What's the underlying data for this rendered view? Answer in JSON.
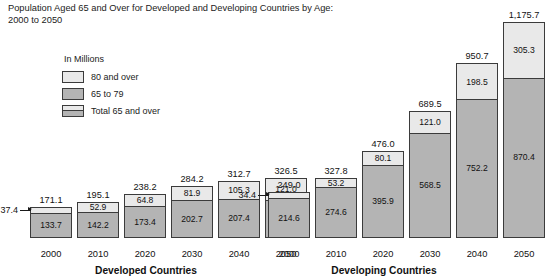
{
  "chart_data": {
    "type": "bar",
    "title": "Population Aged 65 and Over for Developed and Developing Countries by Age:\n2000 to 2050",
    "units_note": "In Millions",
    "xlabel": "",
    "ylabel": "",
    "grid": false,
    "legend_position": "top-left",
    "ylim": [
      0,
      1175.7
    ],
    "categories": [
      "2000",
      "2010",
      "2020",
      "2030",
      "2040",
      "2050"
    ],
    "legend": [
      {
        "key": "80 and over",
        "label": "80 and over",
        "color": "#e9e9e9"
      },
      {
        "key": "65 to 79",
        "label": "65 to 79",
        "color": "#b4b4b4"
      },
      {
        "key": "Total 65 and over",
        "label": "Total 65 and over",
        "color": "#b4b4b4"
      }
    ],
    "groups": [
      {
        "name": "Developed Countries",
        "axis_title": "Developed Countries",
        "series": [
          {
            "name": "65 to 79",
            "values": [
              133.7,
              142.2,
              173.4,
              202.7,
              207.4,
              205.5
            ]
          },
          {
            "name": "80 and over",
            "values": [
              37.4,
              52.9,
              64.8,
              81.9,
              105.3,
              121.0
            ]
          }
        ],
        "totals": [
          171.1,
          195.1,
          238.2,
          284.2,
          312.7,
          326.5
        ],
        "bars": [
          {
            "year": "2000",
            "lower": "133.7",
            "upper": "37.4",
            "total": "171.1",
            "upper_outside": true
          },
          {
            "year": "2010",
            "lower": "142.2",
            "upper": "52.9",
            "total": "195.1",
            "upper_outside": false
          },
          {
            "year": "2020",
            "lower": "173.4",
            "upper": "64.8",
            "total": "238.2",
            "upper_outside": false
          },
          {
            "year": "2030",
            "lower": "202.7",
            "upper": "81.9",
            "total": "284.2",
            "upper_outside": false
          },
          {
            "year": "2040",
            "lower": "207.4",
            "upper": "105.3",
            "total": "312.7",
            "upper_outside": false
          },
          {
            "year": "2050",
            "lower": "205.5",
            "upper": "121.0",
            "total": "326.5",
            "upper_outside": false
          }
        ]
      },
      {
        "name": "Developing Countries",
        "axis_title": "Developing Countries",
        "series": [
          {
            "name": "65 to 79",
            "values": [
              214.6,
              274.6,
              395.9,
              568.5,
              752.2,
              870.4
            ]
          },
          {
            "name": "80 and over",
            "values": [
              34.4,
              53.2,
              80.1,
              121.0,
              198.5,
              305.3
            ]
          }
        ],
        "totals": [
          249.0,
          327.8,
          476.0,
          689.5,
          950.7,
          1175.7
        ],
        "bars": [
          {
            "year": "2000",
            "lower": "214.6",
            "upper": "34.4",
            "total": "249.0",
            "upper_outside": true
          },
          {
            "year": "2010",
            "lower": "274.6",
            "upper": "53.2",
            "total": "327.8",
            "upper_outside": false
          },
          {
            "year": "2020",
            "lower": "395.9",
            "upper": "80.1",
            "total": "476.0",
            "upper_outside": false
          },
          {
            "year": "2030",
            "lower": "568.5",
            "upper": "121.0",
            "total": "689.5",
            "upper_outside": false
          },
          {
            "year": "2040",
            "lower": "752.2",
            "upper": "198.5",
            "total": "950.7",
            "upper_outside": false
          },
          {
            "year": "2050",
            "lower": "870.4",
            "upper": "305.3",
            "total": "1,175.7",
            "upper_outside": false
          }
        ]
      }
    ]
  }
}
